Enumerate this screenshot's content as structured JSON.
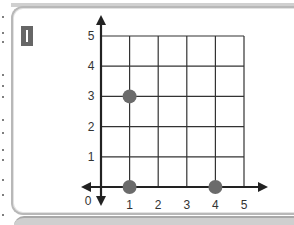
{
  "panel": {
    "label": "I"
  },
  "chart_data": {
    "type": "scatter",
    "title": "",
    "xlabel": "",
    "ylabel": "",
    "xlim": [
      0,
      5
    ],
    "ylim": [
      0,
      5
    ],
    "grid": true,
    "x_ticks": [
      "1",
      "2",
      "3",
      "4",
      "5"
    ],
    "y_ticks": [
      "1",
      "2",
      "3",
      "4",
      "5"
    ],
    "origin_label": "0",
    "points": [
      {
        "x": 1,
        "y": 3
      },
      {
        "x": 1,
        "y": 0
      },
      {
        "x": 4,
        "y": 0
      }
    ],
    "point_color": "#6b6b6b",
    "axis_arrows": [
      "x-left",
      "x-right",
      "y-up",
      "y-down"
    ]
  }
}
